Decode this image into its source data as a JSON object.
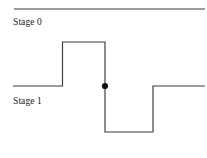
{
  "figure": {
    "type": "timing-waveform-diagram",
    "width": 207,
    "height": 158,
    "background_color": "#ffffff",
    "line_color": "#3a3a3a",
    "marker_color": "#111111",
    "text_color": "#1c1c1c"
  },
  "labels": {
    "stage_0": "Stage 0",
    "stage_1": "Stage 1"
  },
  "chart_data": {
    "type": "line",
    "title": "",
    "xlabel": "",
    "ylabel": "",
    "grid": false,
    "legend_position": "none",
    "axis_ranges": {
      "x": [
        0,
        207
      ],
      "y": [
        0,
        158
      ]
    },
    "levels": {
      "stage_0_reference": 9,
      "high": 42,
      "middle": 86,
      "low": 132
    },
    "series": [
      {
        "name": "stage-0-reference-line",
        "style": "solid",
        "points": [
          {
            "x": 14,
            "y": 9
          },
          {
            "x": 205,
            "y": 9
          }
        ]
      },
      {
        "name": "stage-1-waveform",
        "style": "solid",
        "points": [
          {
            "x": 13,
            "y": 86
          },
          {
            "x": 62.5,
            "y": 86
          },
          {
            "x": 62.5,
            "y": 42
          },
          {
            "x": 105,
            "y": 42
          },
          {
            "x": 105,
            "y": 132
          },
          {
            "x": 153,
            "y": 132
          },
          {
            "x": 153,
            "y": 86
          },
          {
            "x": 205,
            "y": 86
          }
        ]
      }
    ],
    "markers": [
      {
        "name": "transition-marker",
        "x": 105,
        "y": 86,
        "radius": 3.1,
        "shape": "filled-circle"
      }
    ]
  },
  "paths": {
    "reference_line": "M 14 9 L 205 9",
    "waveform": "M 13 86 L 62.5 86 L 62.5 42 L 105 42 L 105 132 L 153 132 L 153 86 L 205 86"
  }
}
